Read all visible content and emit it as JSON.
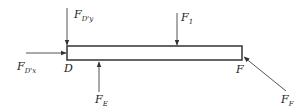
{
  "diagram": {
    "type": "free-body-diagram",
    "beam": {
      "left_point": "D",
      "right_point": "F"
    },
    "forces": [
      {
        "id": "FDy",
        "base": "F",
        "sub": "D'y",
        "direction": "down",
        "location": "D"
      },
      {
        "id": "FDx",
        "base": "F",
        "sub": "D'x",
        "direction": "right",
        "location": "D"
      },
      {
        "id": "F1",
        "base": "F",
        "sub": "1",
        "direction": "down",
        "location": "top-middle"
      },
      {
        "id": "FE",
        "base": "F",
        "sub": "E",
        "direction": "up",
        "location": "bottom-left"
      },
      {
        "id": "FF",
        "base": "F",
        "sub": "F",
        "direction": "up-left diagonal",
        "location": "F"
      }
    ],
    "points": {
      "D": "D",
      "F": "F"
    },
    "colors": {
      "line": "#333333",
      "text": "#222222"
    }
  }
}
